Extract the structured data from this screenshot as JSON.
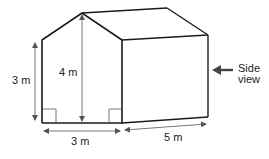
{
  "diagram": {
    "type": "3d-house-prism",
    "colors": {
      "outline": "#1a1a1a",
      "dimension": "#555555",
      "text": "#222222",
      "arrow": "#444444"
    },
    "labels": {
      "wall_height": "3 m",
      "apex_height": "4 m",
      "front_width": "3 m",
      "depth": "5 m",
      "side_view_line1": "Side",
      "side_view_line2": "view"
    }
  }
}
